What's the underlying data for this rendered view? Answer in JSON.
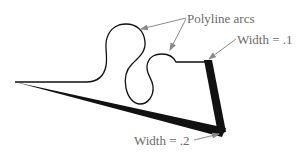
{
  "diagram": {
    "labels": {
      "arcs": "Polyline arcs",
      "width_top": "Width = .1",
      "width_bottom": "Width = .2"
    },
    "colors": {
      "line": "#111111",
      "leader": "#8a8a8a",
      "label": "#6a6a6a"
    }
  }
}
